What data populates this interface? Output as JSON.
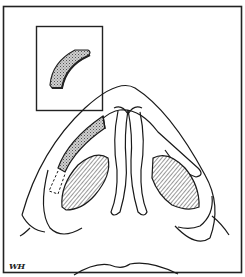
{
  "figure": {
    "inset_label": "graft-detail",
    "signature": "WH"
  },
  "colors": {
    "line": "#1a1a1a",
    "shading": "#8a8a8a",
    "background": "#ffffff"
  }
}
